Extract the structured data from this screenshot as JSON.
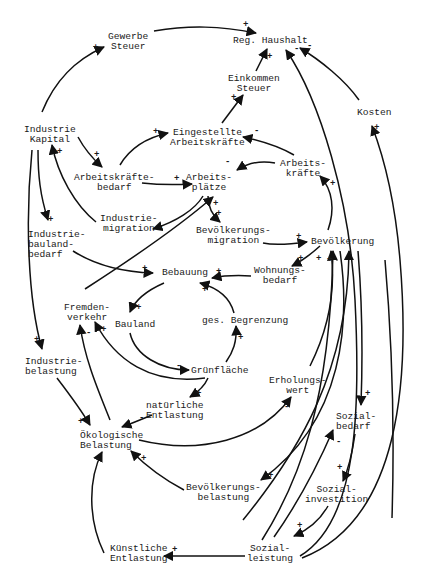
{
  "diagram": {
    "type": "causal-loop-diagram",
    "colors": {
      "ink": "#111111",
      "background": "#ffffff"
    },
    "nodes": {
      "gewerbe_steuer": "Gewerbe\nSteuer",
      "reg_haushalt": "Reg. Haushalt",
      "einkommen_steuer": "Einkommen\nSteuer",
      "kosten": "Kosten",
      "industrie_kapital": "Industrie\nKapital",
      "eingestellte_arbeitskraefte": "Eingestellte\nArbeitskräfte",
      "arbeitskraefte": "Arbeits-\nkräfte",
      "arbeitskraeftebedarf": "Arbeitskräfte-\nbedarf",
      "arbeitsplaetze": "Arbeits-\nplätze",
      "industriemigration": "Industrie-\nmigration",
      "bevoelkerungsmigration": "Bevölkerungs-\nmigration",
      "industriebaulandbedarf": "Industrie-\nbauland-\nbedarf",
      "bevoelkerung": "Bevölkerung",
      "bebauung": "Bebauung",
      "wohnungsbedarf": "Wohnungs-\nbedarf",
      "fremdenverkehr": "Fremden-\nverkehr",
      "bauland": "Bauland",
      "ges_begrenzung": "ges. Begrenzung",
      "gruenflaeche": "Grünfläche",
      "industriebelastung": "Industrie-\nbelastung",
      "erholungswert": "Erholungs-\nwert",
      "natuerliche_entlastung": "natürliche\nEntlastung",
      "oekologische_belastung": "Ökologische\nBelastung",
      "sozialbedarf": "Sozial-\nbedarf",
      "bevoelkerungsbelastung": "Bevölkerungs-\nbelastung",
      "sozialinvestition": "Sozial-\ninvestition",
      "kuenstliche_entlastung": "Künstliche\nEntlastung",
      "sozialleistung": "Sozial-\nleistung"
    },
    "links": [
      {
        "from": "Industrie Kapital",
        "to": "Gewerbe Steuer",
        "sign": "+"
      },
      {
        "from": "Gewerbe Steuer",
        "to": "Reg. Haushalt",
        "sign": "+"
      },
      {
        "from": "Einkommen Steuer",
        "to": "Reg. Haushalt",
        "sign": "+"
      },
      {
        "from": "Eingestellte Arbeitskräfte",
        "to": "Einkommen Steuer",
        "sign": "+"
      },
      {
        "from": "Kosten",
        "to": "Reg. Haushalt",
        "sign": "-"
      },
      {
        "from": "Sozialleistung",
        "to": "Reg. Haushalt",
        "sign": "-"
      },
      {
        "from": "Sozialleistung",
        "to": "Kosten",
        "sign": "+"
      },
      {
        "from": "Industrie Kapital",
        "to": "Arbeitskräftebedarf",
        "sign": "+"
      },
      {
        "from": "Arbeitskräftebedarf",
        "to": "Eingestellte Arbeitskräfte",
        "sign": "+"
      },
      {
        "from": "Arbeitskräfte",
        "to": "Eingestellte Arbeitskräfte",
        "sign": "-"
      },
      {
        "from": "Arbeitskräftebedarf",
        "to": "Arbeitsplätze",
        "sign": "+"
      },
      {
        "from": "Arbeitskräfte",
        "to": "Arbeitsplätze",
        "sign": "-"
      },
      {
        "from": "Arbeitsplätze",
        "to": "Industriemigration",
        "sign": "-"
      },
      {
        "from": "Industriemigration",
        "to": "Industrie Kapital",
        "sign": "+"
      },
      {
        "from": "Arbeitsplätze",
        "to": "Bevölkerungsmigration",
        "sign": "+"
      },
      {
        "from": "Bevölkerungsmigration",
        "to": "Bevölkerung",
        "sign": "+"
      },
      {
        "from": "Bevölkerung",
        "to": "Arbeitskräfte",
        "sign": "+"
      },
      {
        "from": "Industrie Kapital",
        "to": "Industriebaulandbedarf",
        "sign": "+"
      },
      {
        "from": "Industriebaulandbedarf",
        "to": "Bebauung",
        "sign": "+"
      },
      {
        "from": "Bevölkerung",
        "to": "Wohnungsbedarf",
        "sign": "+"
      },
      {
        "from": "Wohnungsbedarf",
        "to": "Bebauung",
        "sign": "+"
      },
      {
        "from": "Fremdenverkehr",
        "to": "Arbeitsplätze",
        "sign": "+"
      },
      {
        "from": "Bebauung",
        "to": "Bauland",
        "sign": "+"
      },
      {
        "from": "Bauland",
        "to": "Grünfläche",
        "sign": "-"
      },
      {
        "from": "Grünfläche",
        "to": "ges. Begrenzung",
        "sign": "+"
      },
      {
        "from": "ges. Begrenzung",
        "to": "Bebauung",
        "sign": "+"
      },
      {
        "from": "Grünfläche",
        "to": "Fremdenverkehr",
        "sign": "+"
      },
      {
        "from": "Grünfläche",
        "to": "natürliche Entlastung",
        "sign": "+"
      },
      {
        "from": "Industrie Kapital",
        "to": "Industriebelastung",
        "sign": "+"
      },
      {
        "from": "Industriebelastung",
        "to": "Ökologische Belastung",
        "sign": "+"
      },
      {
        "from": "natürliche Entlastung",
        "to": "Ökologische Belastung",
        "sign": "-"
      },
      {
        "from": "Ökologische Belastung",
        "to": "Fremdenverkehr",
        "sign": "-"
      },
      {
        "from": "Ökologische Belastung",
        "to": "Erholungswert",
        "sign": "-"
      },
      {
        "from": "Erholungswert",
        "to": "Bevölkerung",
        "sign": "+"
      },
      {
        "from": "Bevölkerung",
        "to": "Bevölkerungsbelastung",
        "sign": "+"
      },
      {
        "from": "Bevölkerungsbelastung",
        "to": "Ökologische Belastung",
        "sign": "+"
      },
      {
        "from": "Bevölkerung",
        "to": "Sozialbedarf",
        "sign": "+"
      },
      {
        "from": "Sozialbedarf",
        "to": "Sozialinvestition",
        "sign": "+"
      },
      {
        "from": "Sozialinvestition",
        "to": "Sozialleistung",
        "sign": "+"
      },
      {
        "from": "Sozialleistung",
        "to": "Sozialbedarf",
        "sign": "-"
      },
      {
        "from": "Sozialleistung",
        "to": "Bevölkerung",
        "sign": "+"
      },
      {
        "from": "Sozialleistung",
        "to": "Künstliche Entlastung",
        "sign": "+"
      },
      {
        "from": "Künstliche Entlastung",
        "to": "Ökologische Belastung",
        "sign": "-"
      }
    ]
  }
}
